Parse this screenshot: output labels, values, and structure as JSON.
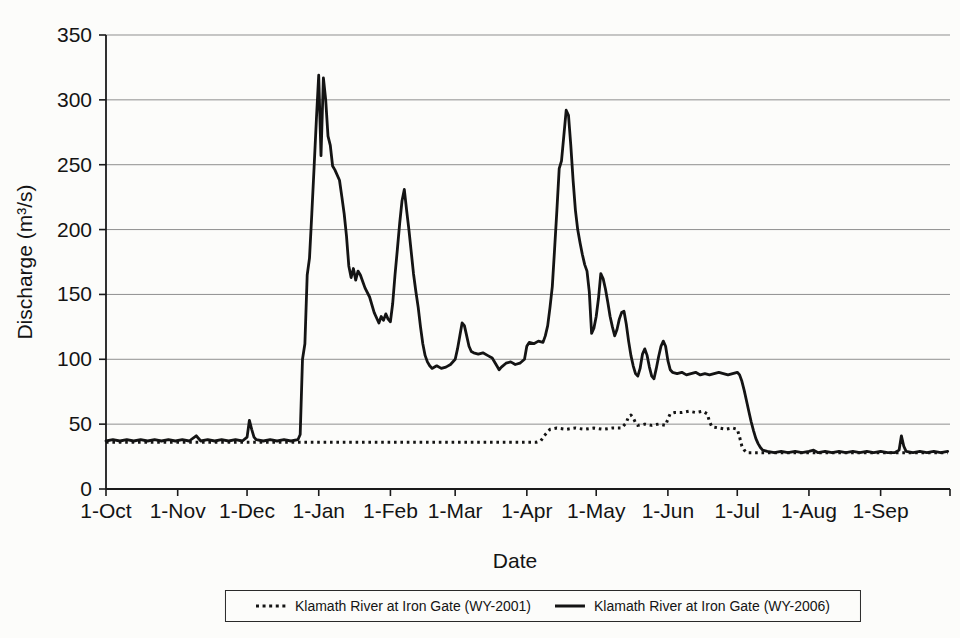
{
  "figure": {
    "background": "#fcfcfa"
  },
  "chart_data": {
    "type": "line",
    "title": "",
    "xlabel": "Date",
    "ylabel": "Discharge (m³/s)",
    "x_unit": "day of water year (0 = 1-Oct)",
    "y_unit": "m³/s",
    "xlim": [
      0,
      365
    ],
    "ylim": [
      0,
      350
    ],
    "grid": "horizontal gridlines every 50",
    "legend_position": "bottom",
    "colors": {
      "axis": "#1a1a1a",
      "grid": "#8f8f8f",
      "text": "#141414",
      "line": "#141414"
    },
    "yticks": [
      0,
      50,
      100,
      150,
      200,
      250,
      300,
      350
    ],
    "xticks": [
      {
        "day": 0,
        "label": "1-Oct"
      },
      {
        "day": 31,
        "label": "1-Nov"
      },
      {
        "day": 61,
        "label": "1-Dec"
      },
      {
        "day": 92,
        "label": "1-Jan"
      },
      {
        "day": 123,
        "label": "1-Feb"
      },
      {
        "day": 151,
        "label": "1-Mar"
      },
      {
        "day": 182,
        "label": "1-Apr"
      },
      {
        "day": 212,
        "label": "1-May"
      },
      {
        "day": 243,
        "label": "1-Jun"
      },
      {
        "day": 273,
        "label": "1-Jul"
      },
      {
        "day": 304,
        "label": "1-Aug"
      },
      {
        "day": 335,
        "label": "1-Sep"
      },
      {
        "day": 365,
        "label": ""
      }
    ],
    "series": [
      {
        "name": "Klamath River at Iron Gate (WY-2001)",
        "style": "dotted",
        "color": "#141414",
        "stroke_width": 3,
        "points": [
          [
            0,
            36
          ],
          [
            7,
            36
          ],
          [
            14,
            36
          ],
          [
            21,
            36
          ],
          [
            28,
            36
          ],
          [
            35,
            36
          ],
          [
            42,
            36
          ],
          [
            49,
            36
          ],
          [
            56,
            36
          ],
          [
            63,
            36
          ],
          [
            70,
            36
          ],
          [
            77,
            36
          ],
          [
            84,
            36
          ],
          [
            91,
            36
          ],
          [
            98,
            36
          ],
          [
            105,
            36
          ],
          [
            112,
            36
          ],
          [
            119,
            36
          ],
          [
            126,
            36
          ],
          [
            133,
            36
          ],
          [
            140,
            36
          ],
          [
            147,
            36
          ],
          [
            154,
            36
          ],
          [
            161,
            36
          ],
          [
            168,
            36
          ],
          [
            175,
            36
          ],
          [
            182,
            36
          ],
          [
            186,
            36
          ],
          [
            188,
            37
          ],
          [
            190,
            42
          ],
          [
            192,
            46
          ],
          [
            195,
            47
          ],
          [
            199,
            46
          ],
          [
            203,
            47
          ],
          [
            207,
            46
          ],
          [
            211,
            47
          ],
          [
            215,
            46
          ],
          [
            219,
            47
          ],
          [
            223,
            47
          ],
          [
            225,
            51
          ],
          [
            226,
            56
          ],
          [
            227,
            57
          ],
          [
            228,
            55
          ],
          [
            229,
            51
          ],
          [
            230,
            49
          ],
          [
            233,
            50
          ],
          [
            236,
            49
          ],
          [
            239,
            50
          ],
          [
            242,
            49
          ],
          [
            243,
            54
          ],
          [
            244,
            58
          ],
          [
            246,
            59
          ],
          [
            249,
            59
          ],
          [
            252,
            60
          ],
          [
            255,
            59
          ],
          [
            258,
            60
          ],
          [
            260,
            58
          ],
          [
            261,
            52
          ],
          [
            262,
            48
          ],
          [
            265,
            47
          ],
          [
            268,
            46
          ],
          [
            271,
            47
          ],
          [
            273,
            46
          ],
          [
            274,
            40
          ],
          [
            275,
            33
          ],
          [
            276,
            30
          ],
          [
            277,
            28
          ],
          [
            281,
            28
          ],
          [
            286,
            28
          ],
          [
            291,
            28
          ],
          [
            296,
            28
          ],
          [
            301,
            28
          ],
          [
            306,
            28
          ],
          [
            311,
            28
          ],
          [
            316,
            28
          ],
          [
            321,
            28
          ],
          [
            326,
            28
          ],
          [
            331,
            28
          ],
          [
            336,
            28
          ],
          [
            341,
            28
          ],
          [
            346,
            28
          ],
          [
            351,
            28
          ],
          [
            356,
            28
          ],
          [
            361,
            28
          ],
          [
            364,
            28
          ]
        ]
      },
      {
        "name": "Klamath River at Iron Gate (WY-2006)",
        "style": "solid",
        "color": "#141414",
        "stroke_width": 2.8,
        "points": [
          [
            0,
            37
          ],
          [
            3,
            38
          ],
          [
            6,
            37
          ],
          [
            9,
            38
          ],
          [
            12,
            37
          ],
          [
            15,
            38
          ],
          [
            18,
            37
          ],
          [
            21,
            38
          ],
          [
            24,
            37
          ],
          [
            27,
            38
          ],
          [
            30,
            37
          ],
          [
            33,
            38
          ],
          [
            36,
            37
          ],
          [
            39,
            41
          ],
          [
            41,
            37
          ],
          [
            44,
            38
          ],
          [
            47,
            37
          ],
          [
            50,
            38
          ],
          [
            53,
            37
          ],
          [
            56,
            38
          ],
          [
            59,
            37
          ],
          [
            61,
            40
          ],
          [
            62,
            53
          ],
          [
            63,
            46
          ],
          [
            64,
            40
          ],
          [
            65,
            38
          ],
          [
            68,
            37
          ],
          [
            71,
            38
          ],
          [
            74,
            37
          ],
          [
            77,
            38
          ],
          [
            80,
            37
          ],
          [
            83,
            38
          ],
          [
            84,
            42
          ],
          [
            85,
            100
          ],
          [
            86,
            112
          ],
          [
            87,
            165
          ],
          [
            88,
            178
          ],
          [
            89,
            212
          ],
          [
            90,
            248
          ],
          [
            91,
            285
          ],
          [
            92,
            319
          ],
          [
            93,
            257
          ],
          [
            94,
            317
          ],
          [
            95,
            300
          ],
          [
            96,
            272
          ],
          [
            97,
            265
          ],
          [
            98,
            249
          ],
          [
            99,
            246
          ],
          [
            101,
            238
          ],
          [
            102,
            225
          ],
          [
            103,
            212
          ],
          [
            104,
            195
          ],
          [
            105,
            172
          ],
          [
            106,
            163
          ],
          [
            107,
            170
          ],
          [
            108,
            161
          ],
          [
            109,
            168
          ],
          [
            110,
            165
          ],
          [
            111,
            160
          ],
          [
            112,
            155
          ],
          [
            114,
            148
          ],
          [
            116,
            136
          ],
          [
            118,
            128
          ],
          [
            119,
            133
          ],
          [
            120,
            130
          ],
          [
            121,
            135
          ],
          [
            122,
            131
          ],
          [
            123,
            129
          ],
          [
            124,
            143
          ],
          [
            125,
            165
          ],
          [
            126,
            185
          ],
          [
            127,
            205
          ],
          [
            128,
            222
          ],
          [
            129,
            231
          ],
          [
            130,
            215
          ],
          [
            131,
            200
          ],
          [
            132,
            183
          ],
          [
            133,
            166
          ],
          [
            134,
            152
          ],
          [
            135,
            140
          ],
          [
            136,
            125
          ],
          [
            137,
            112
          ],
          [
            138,
            103
          ],
          [
            139,
            98
          ],
          [
            140,
            95
          ],
          [
            141,
            93
          ],
          [
            143,
            95
          ],
          [
            145,
            93
          ],
          [
            147,
            94
          ],
          [
            149,
            96
          ],
          [
            151,
            100
          ],
          [
            152,
            108
          ],
          [
            153,
            118
          ],
          [
            154,
            128
          ],
          [
            155,
            126
          ],
          [
            156,
            118
          ],
          [
            157,
            110
          ],
          [
            158,
            106
          ],
          [
            159,
            105
          ],
          [
            161,
            104
          ],
          [
            163,
            105
          ],
          [
            165,
            103
          ],
          [
            167,
            101
          ],
          [
            169,
            95
          ],
          [
            170,
            92
          ],
          [
            171,
            94
          ],
          [
            173,
            97
          ],
          [
            175,
            98
          ],
          [
            177,
            96
          ],
          [
            179,
            97
          ],
          [
            181,
            100
          ],
          [
            182,
            110
          ],
          [
            183,
            113
          ],
          [
            185,
            112
          ],
          [
            187,
            114
          ],
          [
            189,
            113
          ],
          [
            190,
            118
          ],
          [
            191,
            126
          ],
          [
            192,
            140
          ],
          [
            193,
            156
          ],
          [
            194,
            185
          ],
          [
            195,
            215
          ],
          [
            196,
            247
          ],
          [
            197,
            253
          ],
          [
            198,
            272
          ],
          [
            199,
            292
          ],
          [
            200,
            288
          ],
          [
            201,
            265
          ],
          [
            202,
            238
          ],
          [
            203,
            215
          ],
          [
            204,
            200
          ],
          [
            205,
            190
          ],
          [
            206,
            181
          ],
          [
            207,
            173
          ],
          [
            208,
            168
          ],
          [
            209,
            152
          ],
          [
            210,
            120
          ],
          [
            211,
            124
          ],
          [
            212,
            133
          ],
          [
            213,
            147
          ],
          [
            214,
            166
          ],
          [
            215,
            162
          ],
          [
            216,
            154
          ],
          [
            217,
            144
          ],
          [
            218,
            133
          ],
          [
            219,
            125
          ],
          [
            220,
            118
          ],
          [
            221,
            123
          ],
          [
            222,
            131
          ],
          [
            223,
            136
          ],
          [
            224,
            137
          ],
          [
            225,
            127
          ],
          [
            226,
            114
          ],
          [
            227,
            103
          ],
          [
            228,
            95
          ],
          [
            229,
            89
          ],
          [
            230,
            87
          ],
          [
            231,
            93
          ],
          [
            232,
            104
          ],
          [
            233,
            108
          ],
          [
            234,
            103
          ],
          [
            235,
            94
          ],
          [
            236,
            87
          ],
          [
            237,
            85
          ],
          [
            238,
            93
          ],
          [
            239,
            102
          ],
          [
            240,
            110
          ],
          [
            241,
            114
          ],
          [
            242,
            110
          ],
          [
            243,
            99
          ],
          [
            244,
            92
          ],
          [
            245,
            90
          ],
          [
            247,
            89
          ],
          [
            249,
            90
          ],
          [
            251,
            88
          ],
          [
            253,
            89
          ],
          [
            255,
            90
          ],
          [
            257,
            88
          ],
          [
            259,
            89
          ],
          [
            261,
            88
          ],
          [
            263,
            89
          ],
          [
            265,
            90
          ],
          [
            267,
            89
          ],
          [
            269,
            88
          ],
          [
            271,
            89
          ],
          [
            273,
            90
          ],
          [
            274,
            88
          ],
          [
            275,
            83
          ],
          [
            276,
            76
          ],
          [
            277,
            68
          ],
          [
            278,
            60
          ],
          [
            279,
            52
          ],
          [
            280,
            45
          ],
          [
            281,
            39
          ],
          [
            282,
            35
          ],
          [
            283,
            32
          ],
          [
            284,
            30
          ],
          [
            286,
            29
          ],
          [
            289,
            28
          ],
          [
            292,
            29
          ],
          [
            295,
            28
          ],
          [
            298,
            29
          ],
          [
            301,
            28
          ],
          [
            304,
            29
          ],
          [
            306,
            30
          ],
          [
            308,
            28
          ],
          [
            311,
            29
          ],
          [
            314,
            28
          ],
          [
            317,
            29
          ],
          [
            320,
            28
          ],
          [
            323,
            29
          ],
          [
            326,
            28
          ],
          [
            329,
            29
          ],
          [
            332,
            28
          ],
          [
            335,
            29
          ],
          [
            338,
            28
          ],
          [
            341,
            28
          ],
          [
            343,
            30
          ],
          [
            344,
            41
          ],
          [
            345,
            33
          ],
          [
            346,
            29
          ],
          [
            349,
            28
          ],
          [
            352,
            29
          ],
          [
            355,
            28
          ],
          [
            358,
            29
          ],
          [
            361,
            28
          ],
          [
            364,
            29
          ]
        ]
      }
    ]
  }
}
